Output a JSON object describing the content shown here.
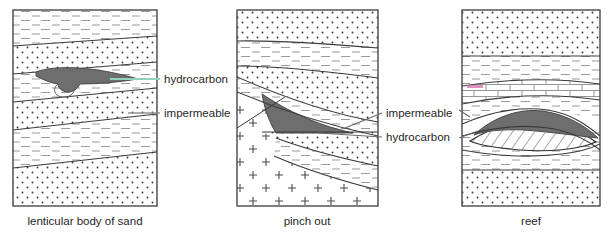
{
  "figure": {
    "background_color": "#ffffff",
    "outline_color": "#3a3a3a",
    "hydrocarbon_color": "#6e6e6e",
    "leader_color_green": "#8fd3bd",
    "leader_color_gray": "#8c8c8c",
    "pattern_color": "#5a5a5a",
    "pink_mark_color": "#cf6fae"
  },
  "panels": [
    {
      "id": "lenticular",
      "caption": "lenticular body of sand",
      "caption_x": 85,
      "frame": {
        "x": 13,
        "y": 10,
        "width": 144,
        "height": 196
      },
      "layers": [
        {
          "name": "shale-top",
          "pattern": "dash"
        },
        {
          "name": "sand-upper",
          "pattern": "dots"
        },
        {
          "name": "shale-reservoir",
          "pattern": "dash"
        },
        {
          "name": "sand-mid",
          "pattern": "dots"
        },
        {
          "name": "shale-lower",
          "pattern": "dash"
        },
        {
          "name": "sand-base",
          "pattern": "dots"
        }
      ]
    },
    {
      "id": "pinchout",
      "caption": "pinch out",
      "caption_x": 307,
      "frame": {
        "x": 237,
        "y": 10,
        "width": 141,
        "height": 196
      },
      "layers": [
        {
          "name": "sand-top",
          "pattern": "dots"
        },
        {
          "name": "shale-upper",
          "pattern": "dash"
        },
        {
          "name": "sand-upper",
          "pattern": "dots"
        },
        {
          "name": "shale-seal",
          "pattern": "dash"
        },
        {
          "name": "basement",
          "pattern": "cross"
        }
      ]
    },
    {
      "id": "reef",
      "caption": "reef",
      "caption_x": 531,
      "frame": {
        "x": 462,
        "y": 10,
        "width": 138,
        "height": 196
      },
      "layers": [
        {
          "name": "sand-top",
          "pattern": "dots"
        },
        {
          "name": "shale-upper",
          "pattern": "dash"
        },
        {
          "name": "limestone",
          "pattern": "brick"
        },
        {
          "name": "reef-core",
          "pattern": "hatch"
        },
        {
          "name": "shale-lower",
          "pattern": "dash"
        },
        {
          "name": "sand-base",
          "pattern": "dots"
        }
      ]
    }
  ],
  "annotations": [
    {
      "id": "lenticular-hydrocarbon",
      "text": "hydrocarbon",
      "text_x": 164,
      "text_y": 83,
      "leader_color": "#8fd3bd",
      "leader": {
        "x1": 110,
        "y1": 79,
        "x2": 160,
        "y2": 79
      }
    },
    {
      "id": "lenticular-impermeable",
      "text": "impermeable",
      "text_x": 164,
      "text_y": 117,
      "leader_color": "#8c8c8c",
      "leader": {
        "x1": 128,
        "y1": 113,
        "x2": 160,
        "y2": 113
      }
    },
    {
      "id": "pinchout-impermeable",
      "text": "impermeable",
      "text_x": 386,
      "text_y": 117,
      "leader_color": "#6b6b6b",
      "leader": {
        "x1": 345,
        "y1": 128,
        "x2": 382,
        "y2": 113
      }
    },
    {
      "id": "pinchout-hydrocarbon",
      "text": "hydrocarbon",
      "text_x": 386,
      "text_y": 141,
      "leader_color": "#6b6b6b",
      "leader": {
        "x1": 320,
        "y1": 133,
        "x2": 382,
        "y2": 137
      }
    }
  ]
}
